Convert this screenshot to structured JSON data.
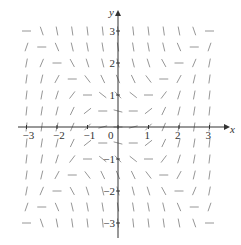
{
  "chart_data": {
    "type": "direction_field",
    "title": "",
    "equation": "dy/dx = x^2 - y^2",
    "xlabel": "x",
    "ylabel": "y",
    "xlim": [
      -3.5,
      3.5
    ],
    "ylim": [
      -3.5,
      3.5
    ],
    "x_ticks": [
      -3,
      -2,
      -1,
      0,
      1,
      2,
      3
    ],
    "y_ticks": [
      -3,
      -2,
      -1,
      1,
      2,
      3
    ],
    "x_tick_labels": [
      "−3",
      "−2",
      "−1",
      "0",
      "1",
      "2",
      "3"
    ],
    "y_tick_labels": [
      "−3",
      "−2",
      "−1",
      "1",
      "2",
      "3"
    ],
    "origin_label": "0",
    "grid": false,
    "segment_grid": {
      "x_values": [
        -3,
        -2.5,
        -2,
        -1.5,
        -1,
        -0.5,
        0,
        0.5,
        1,
        1.5,
        2,
        2.5,
        3
      ],
      "y_values": [
        -3,
        -2.5,
        -2,
        -1.5,
        -1,
        -0.5,
        0,
        0.5,
        1,
        1.5,
        2,
        2.5,
        3
      ],
      "segment_length_px": 9
    },
    "colors": {
      "axis": "#333333",
      "segments": "#8a8a8a"
    }
  },
  "layout": {
    "origin_px": [
      118,
      127
    ],
    "x_unit_px": 30.5,
    "y_unit_px": 32,
    "x_axis_extent_px": [
      18,
      226
    ],
    "y_axis_extent_px": [
      14,
      238
    ]
  }
}
